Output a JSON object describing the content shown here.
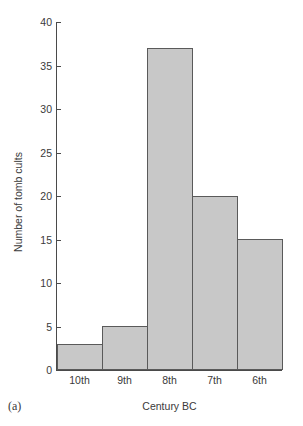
{
  "figure": {
    "label": "(a)",
    "background_color": "#ffffff"
  },
  "chart_data": {
    "type": "bar",
    "title": "",
    "categories": [
      "10th",
      "9th",
      "8th",
      "7th",
      "6th"
    ],
    "values": [
      3,
      5,
      37,
      20,
      15
    ],
    "xlabel": "Century BC",
    "ylabel": "Number of tomb cults",
    "ylim": [
      0,
      40
    ],
    "yticks": [
      0,
      5,
      10,
      15,
      20,
      25,
      30,
      35,
      40
    ],
    "ytick_labels": [
      "0",
      "5",
      "10",
      "15",
      "20",
      "25",
      "30",
      "35",
      "40"
    ],
    "grid": false,
    "legend": false,
    "bar_fill_color": "#c8c8c8",
    "bar_edge_color": "#5a5a5a",
    "axis_color": "#4a4a4a",
    "bar_gap": 0
  }
}
